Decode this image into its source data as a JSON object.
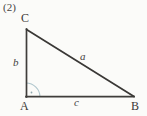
{
  "figure": {
    "item_number": "(2)",
    "type": "right-triangle-diagram",
    "background_color": "#fbfbf9",
    "stroke_color": "#3a3836",
    "angle_mark_color": "#aac4cc",
    "vertices": {
      "C": {
        "label": "C",
        "x": 26,
        "y": 29
      },
      "A": {
        "label": "A",
        "x": 26,
        "y": 97
      },
      "B": {
        "label": "B",
        "x": 134,
        "y": 97
      }
    },
    "sides": {
      "a": {
        "label": "a",
        "description": "hypotenuse-C-to-B"
      },
      "b": {
        "label": "b",
        "description": "vertical-leg-A-to-C"
      },
      "c": {
        "label": "c",
        "description": "horizontal-leg-A-to-B"
      }
    },
    "right_angle": {
      "at_vertex": "A",
      "marker": "quarter-arc-with-center-dot"
    }
  }
}
